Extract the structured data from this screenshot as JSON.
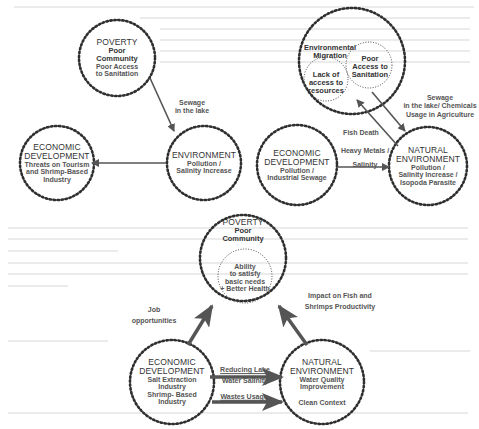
{
  "diagrams": {
    "top_left": {
      "nodes": {
        "poverty": {
          "title": "POVERTY",
          "subtitle": "Poor",
          "subtitle2": "Community",
          "line1": "Poor Access",
          "line2": "to Sanitation"
        },
        "economic": {
          "title": "ECONOMIC",
          "title2": "DEVELOPMENT",
          "line1": "Threats on Tourism",
          "line2": "and Shrimp-Based",
          "line3": "Industry"
        },
        "environment": {
          "title": "ENVIRONMENT",
          "line1": "Pollution /",
          "line2": "Salinity Increase"
        }
      },
      "edges": {
        "sewage": {
          "line1": "Sewage",
          "line2": "in the lake"
        }
      }
    },
    "top_right": {
      "nodes": {
        "migration": {
          "title": "Environmental",
          "title2": "Migration"
        },
        "lack_access": {
          "line1": "Lack of",
          "line2": "access to",
          "line3": "resources"
        },
        "poor_access": {
          "line1": "Poor",
          "line2": "Access to",
          "line3": "Sanitation"
        },
        "economic": {
          "title": "ECONOMIC",
          "title2": "DEVELOPMENT",
          "line1": "Pollution /",
          "line2": "Industrial Sewage"
        },
        "natural": {
          "title": "NATURAL",
          "title2": "ENVIRONMENT",
          "line1": "Pollution /",
          "line2": "Salinity Increase /",
          "line3": "Isopoda Parasite"
        }
      },
      "edges": {
        "sewage_chem": {
          "line1": "Sewage",
          "line2": "in the lake/ Chemicals",
          "line3": "Usage in Agriculture"
        },
        "fish_death": {
          "label": "Fish Death"
        },
        "heavy_metals": {
          "line1": "Heavy Metals /",
          "line2": "Salinity"
        }
      }
    },
    "bottom": {
      "nodes": {
        "poverty": {
          "title": "POVERTY",
          "subtitle": "Poor",
          "subtitle2": "Community",
          "line1": "Ability",
          "line2": "to satisfy",
          "line3": "basic needs",
          "line4": "+ Better Health"
        },
        "economic": {
          "title": "ECONOMIC",
          "title2": "DEVELOPMENT",
          "line1": "Salt Extraction",
          "line2": "Industry",
          "line3": "Shrimp- Based",
          "line4": "Industry"
        },
        "natural": {
          "title": "NATURAL",
          "title2": "ENVIRONMENT",
          "line1": "Water Quality",
          "line2": "Improvement",
          "line3": "Clean Context"
        }
      },
      "edges": {
        "jobs": {
          "line1": "Job",
          "line2": "opportunities"
        },
        "impact": {
          "line1": "Impact on Fish and",
          "line2": "Shrimps Productivity"
        },
        "salinity": {
          "line1": "Reducing Lake",
          "line2": "Water Salinity"
        },
        "wastes": {
          "label": "Wastes Usage"
        }
      }
    }
  },
  "colors": {
    "stroke": "#2f2f2f",
    "arrow": "#555555",
    "text": "#333333",
    "bg_text": "#ebebeb"
  }
}
